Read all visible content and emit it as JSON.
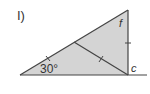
{
  "problem": {
    "label": "I)"
  },
  "triangle": {
    "vertices": {
      "left": [
        20,
        75
      ],
      "apex": [
        128,
        10
      ],
      "right_angle": [
        128,
        75
      ]
    },
    "baseline_end": [
      147,
      75
    ],
    "interior_segment": {
      "from": [
        74,
        42
      ],
      "to": [
        128,
        75
      ]
    },
    "fill_color": "#d4d4d4",
    "line_color": "#444444"
  },
  "labels": {
    "angle": "30°",
    "f": "f",
    "c": "c"
  },
  "tick_marks": [
    {
      "name": "hypotenuse-lower-tick",
      "at": [
        48,
        58
      ]
    },
    {
      "name": "interior-segment-tick",
      "at": [
        101,
        59
      ]
    },
    {
      "name": "vertical-side-tick",
      "at": [
        128,
        43
      ]
    }
  ]
}
